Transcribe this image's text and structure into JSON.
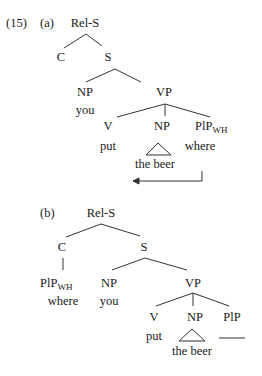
{
  "example_number": "(15)",
  "tree_a": {
    "label": "(a)",
    "root": "Rel-S",
    "c": "C",
    "s": "S",
    "np_subject": "NP",
    "np_subject_word": "you",
    "vp": "VP",
    "v": "V",
    "v_word": "put",
    "np_object": "NP",
    "np_object_word": "the beer",
    "plp": "PlP",
    "plp_sub": "WH",
    "plp_word": "where",
    "movement_arrow": "left-arrow"
  },
  "tree_b": {
    "label": "(b)",
    "root": "Rel-S",
    "c": "C",
    "c_child": "PlP",
    "c_child_sub": "WH",
    "c_child_word": "where",
    "s": "S",
    "np_subject": "NP",
    "np_subject_word": "you",
    "vp": "VP",
    "v": "V",
    "v_word": "put",
    "np_object": "NP",
    "np_object_word": "the beer",
    "plp": "PlP",
    "trace": "gap-line"
  }
}
